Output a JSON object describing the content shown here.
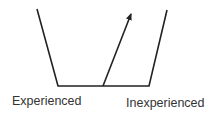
{
  "diagram": {
    "labels": {
      "left": "Experienced",
      "right": "Inexperienced"
    },
    "colors": {
      "stroke": "#222222",
      "text": "#333333",
      "background": "#ffffff"
    }
  }
}
